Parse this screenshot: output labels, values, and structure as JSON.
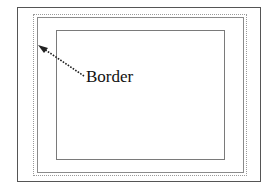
{
  "diagram": {
    "label": "Border",
    "annotation_target": "border",
    "colors": {
      "outer_frame": "#555555",
      "border_dotted": "#9a9a9a",
      "border_solid": "#8a8a8a",
      "content_box": "#7a7a7a",
      "arrow": "#222222",
      "text": "#111111"
    },
    "arrow": {
      "style": "dotted",
      "from": [
        84,
        76
      ],
      "to": [
        39,
        46
      ],
      "icon": "arrow-icon"
    }
  }
}
